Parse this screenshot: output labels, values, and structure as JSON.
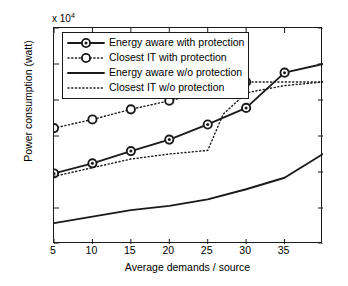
{
  "chart_data": {
    "type": "line",
    "title": "",
    "xlabel": "Average demands / source",
    "ylabel": "Power consumption (watt)",
    "y_multiplier": "x 10",
    "y_multiplier_exp": "4",
    "xlim": [
      5,
      40
    ],
    "ylim": [
      0.5,
      3.5
    ],
    "xticks": [
      "5",
      "10",
      "15",
      "20",
      "25",
      "30",
      "35"
    ],
    "yticks": [
      "3.5",
      "3",
      "2.5",
      "2",
      "1.5",
      "1",
      "0.5"
    ],
    "grid": false,
    "legend_position": "upper-left",
    "series": [
      {
        "name": "Energy aware with protection",
        "style": "solid-marker",
        "marker": "filled-circle",
        "color": "#1a1a1a",
        "x": [
          5,
          10,
          15,
          20,
          25,
          30,
          35,
          40
        ],
        "values": [
          1.48,
          1.62,
          1.79,
          1.95,
          2.16,
          2.39,
          2.88,
          3.0
        ]
      },
      {
        "name": "Closest IT with protection",
        "style": "dotted-marker",
        "marker": "open-circle",
        "color": "#1a1a1a",
        "x": [
          5,
          10,
          15,
          20,
          25,
          30,
          40
        ],
        "values": [
          2.11,
          2.23,
          2.37,
          2.49,
          2.61,
          2.75,
          2.75
        ]
      },
      {
        "name": "Energy aware w/o protection",
        "style": "solid",
        "marker": "none",
        "color": "#1a1a1a",
        "x": [
          5,
          10,
          15,
          20,
          25,
          30,
          35,
          40
        ],
        "values": [
          0.79,
          0.88,
          0.97,
          1.03,
          1.12,
          1.26,
          1.42,
          1.75
        ]
      },
      {
        "name": "Closest IT w/o protection",
        "style": "dotted",
        "marker": "none",
        "color": "#1a1a1a",
        "x": [
          5,
          10,
          15,
          20,
          25,
          27,
          30,
          35,
          40
        ],
        "values": [
          1.44,
          1.56,
          1.68,
          1.75,
          1.8,
          2.3,
          2.6,
          2.7,
          2.75
        ]
      }
    ]
  },
  "legend": {
    "items": [
      {
        "label": "Energy aware with protection"
      },
      {
        "label": "Closest IT with protection"
      },
      {
        "label": "Energy aware w/o protection"
      },
      {
        "label": "Closest IT w/o protection"
      }
    ]
  }
}
